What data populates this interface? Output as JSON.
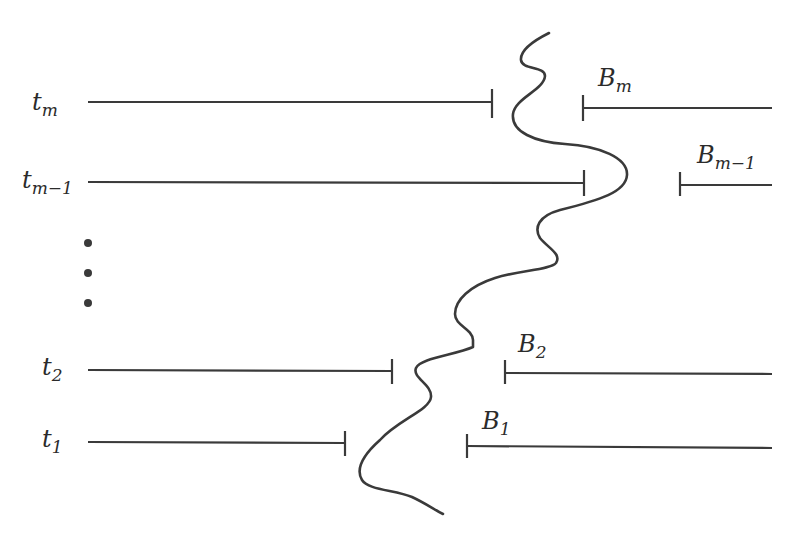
{
  "diagram": {
    "rows": [
      {
        "id": "tm",
        "left_label": "t",
        "left_sub": "m",
        "right_label": "B",
        "right_sub": "m",
        "y_left": 102,
        "y_right": 108,
        "left_start": 88,
        "left_end": 492,
        "right_start": 583,
        "right_end": 772,
        "bx": 583,
        "by": 86
      },
      {
        "id": "tm1",
        "left_label": "t",
        "left_sub": "m−1",
        "right_label": "B",
        "right_sub": "m−1",
        "y_left": 182,
        "y_right": 185,
        "left_start": 88,
        "left_end": 584,
        "right_start": 680,
        "right_end": 772,
        "bx": 682,
        "by": 164
      },
      {
        "id": "t2",
        "left_label": "t",
        "left_sub": "2",
        "right_label": "B",
        "right_sub": "2",
        "y_left": 371,
        "y_right": 374,
        "left_start": 88,
        "left_end": 392,
        "right_start": 505,
        "right_end": 772,
        "bx": 517,
        "by": 353
      },
      {
        "id": "t1",
        "left_label": "t",
        "left_sub": "1",
        "right_label": "B",
        "right_sub": "1",
        "y_left": 444,
        "y_right": 448,
        "left_start": 88,
        "left_end": 345,
        "right_start": 467,
        "right_end": 772,
        "bx": 481,
        "by": 428
      }
    ],
    "ellipsis_dots": [
      {
        "x": 88,
        "y": 243
      },
      {
        "x": 88,
        "y": 273
      },
      {
        "x": 88,
        "y": 303
      }
    ],
    "colors": {
      "ink": "#3a3a3a",
      "background": "#ffffff"
    }
  },
  "labels": {
    "tm": "t",
    "tm_sub": "m",
    "tm1": "t",
    "tm1_sub": "m−1",
    "t2": "t",
    "t2_sub": "2",
    "t1": "t",
    "t1_sub": "1",
    "Bm": "B",
    "Bm_sub": "m",
    "Bm1": "B",
    "Bm1_sub": "m−1",
    "B2": "B",
    "B2_sub": "2",
    "B1": "B",
    "B1_sub": "1"
  }
}
